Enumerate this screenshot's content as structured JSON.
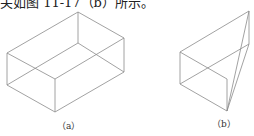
{
  "document": {
    "cut_text": "关如图 11-17（b）所示。",
    "figures": [
      {
        "id": "a",
        "label": "（a）",
        "shape": "rectangular box (cuboid) wireframe"
      },
      {
        "id": "b",
        "label": "（b）",
        "shape": "wedge / truncated prism wireframe"
      }
    ]
  }
}
